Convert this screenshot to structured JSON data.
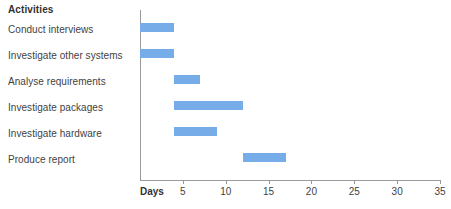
{
  "chart_data": {
    "type": "bar",
    "subtype": "gantt",
    "title": "",
    "xlabel": "Days",
    "ylabel": "Activities",
    "categories": [
      "Conduct interviews",
      "Investigate other systems",
      "Analyse requirements",
      "Investigate packages",
      "Investigate hardware",
      "Produce report"
    ],
    "tasks": [
      {
        "name": "Conduct interviews",
        "start": 0,
        "end": 4,
        "duration": 4
      },
      {
        "name": "Investigate other systems",
        "start": 0,
        "end": 4,
        "duration": 4
      },
      {
        "name": "Analyse requirements",
        "start": 4,
        "end": 7,
        "duration": 3
      },
      {
        "name": "Investigate packages",
        "start": 4,
        "end": 12,
        "duration": 8
      },
      {
        "name": "Investigate hardware",
        "start": 4,
        "end": 9,
        "duration": 5
      },
      {
        "name": "Produce report",
        "start": 12,
        "end": 17,
        "duration": 5
      }
    ],
    "xlim": [
      0,
      35
    ],
    "xticks": [
      5,
      10,
      15,
      20,
      25,
      30,
      35
    ],
    "xtick_labels": [
      "5",
      "10",
      "15",
      "20",
      "25",
      "30",
      "35"
    ],
    "grid": false,
    "legend": false,
    "bar_color": "#76ace8",
    "axis_color": "#9a9a9a",
    "text_color": "#3f3f3f"
  },
  "header": {
    "activities_label": "Activities",
    "days_label": "Days"
  }
}
